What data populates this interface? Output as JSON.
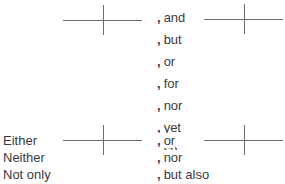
{
  "diagram": {
    "type": "compound-sentence-diagram",
    "comma": ",",
    "coordinating_conjunctions": [
      "and",
      "but",
      "or",
      "for",
      "nor",
      "yet",
      "so"
    ],
    "correlative_conjunctions": [
      {
        "first": "Either",
        "second": "or"
      },
      {
        "first": "Neither",
        "second": "nor"
      },
      {
        "first": "Not only",
        "second": "but also"
      }
    ],
    "line_color": "#6a6a6a",
    "text_color": "#3a3a3a"
  }
}
